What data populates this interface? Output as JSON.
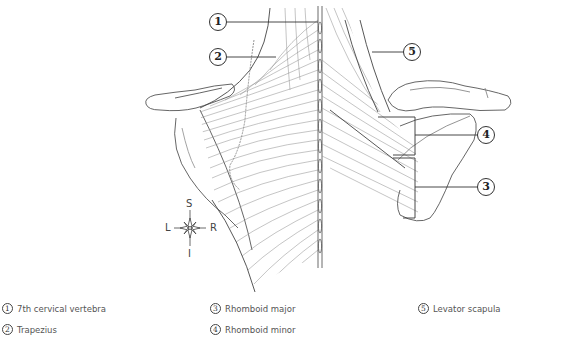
{
  "figure": {
    "callouts": [
      {
        "num": "1",
        "structure": "7th cervical vertebra"
      },
      {
        "num": "2",
        "structure": "Trapezius"
      },
      {
        "num": "3",
        "structure": "Rhomboid major"
      },
      {
        "num": "4",
        "structure": "Rhomboid minor"
      },
      {
        "num": "5",
        "structure": "Levator scapula"
      }
    ],
    "colors": {
      "line": "#333333",
      "muscle_fiber": "#8a8a8a",
      "background": "#ffffff"
    }
  },
  "compass": {
    "superior": "S",
    "inferior": "I",
    "left": "L",
    "right": "R"
  },
  "legend": {
    "items": [
      {
        "num": "1",
        "label": "7th cervical vertebra"
      },
      {
        "num": "2",
        "label": "Trapezius"
      },
      {
        "num": "3",
        "label": "Rhomboid major"
      },
      {
        "num": "4",
        "label": "Rhomboid minor"
      },
      {
        "num": "5",
        "label": "Levator scapula"
      }
    ]
  }
}
